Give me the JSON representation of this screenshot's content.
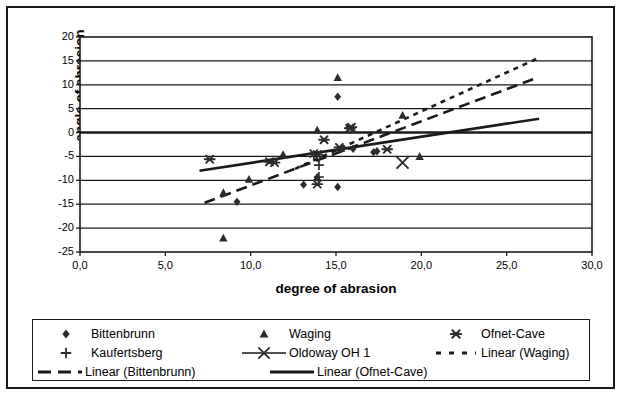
{
  "chart_data": {
    "type": "scatter",
    "title": "",
    "xlabel": "degree of abrasion",
    "ylabel": "angle of abrasion",
    "xlim": [
      0,
      30
    ],
    "ylim": [
      -25,
      20
    ],
    "xticks": [
      "0,0",
      "5,0",
      "10,0",
      "15,0",
      "20,0",
      "25,0",
      "30,0"
    ],
    "xtick_values": [
      0,
      5,
      10,
      15,
      20,
      25,
      30
    ],
    "yticks": [
      "20",
      "15",
      "10",
      "5",
      "0",
      "-5",
      "-10",
      "-15",
      "-20",
      "-25"
    ],
    "ytick_values": [
      20,
      15,
      10,
      5,
      0,
      -5,
      -10,
      -15,
      -20,
      -25
    ],
    "grid": "horizontal",
    "legend_position": "below",
    "series": [
      {
        "name": "Bittenbrunn",
        "marker": "diamond",
        "points": [
          [
            9.2,
            -14.5
          ],
          [
            13.1,
            -10.9
          ],
          [
            13.9,
            -9.4
          ],
          [
            15.1,
            -11.4
          ],
          [
            15.1,
            7.5
          ],
          [
            15.4,
            -3.3
          ],
          [
            16.0,
            -3.4
          ],
          [
            17.2,
            -4.1
          ],
          [
            17.4,
            -3.9
          ]
        ]
      },
      {
        "name": "Waging",
        "marker": "triangle",
        "points": [
          [
            8.4,
            -12.6
          ],
          [
            8.4,
            -22.1
          ],
          [
            9.9,
            -9.8
          ],
          [
            11.9,
            -4.6
          ],
          [
            13.9,
            -9.4
          ],
          [
            13.9,
            0.5
          ],
          [
            15.1,
            11.5
          ],
          [
            15.3,
            -3.3
          ],
          [
            18.9,
            3.6
          ],
          [
            19.9,
            -5.0
          ]
        ]
      },
      {
        "name": "Ofnet-Cave",
        "marker": "asterisk-x",
        "points": [
          [
            7.6,
            -5.6
          ],
          [
            11.1,
            -6.1
          ],
          [
            11.4,
            -6.3
          ],
          [
            13.7,
            -4.4
          ],
          [
            13.9,
            -4.6
          ],
          [
            13.9,
            -10.8
          ],
          [
            14.3,
            -1.5
          ],
          [
            15.2,
            -3.1
          ],
          [
            15.8,
            0.9
          ],
          [
            15.9,
            1.1
          ],
          [
            18.0,
            -3.5
          ]
        ]
      },
      {
        "name": "Kaufertsberg",
        "marker": "plus",
        "points": [
          [
            14.0,
            -6.8
          ],
          [
            14.0,
            -9.3
          ]
        ]
      },
      {
        "name": "Oldoway OH 1",
        "marker": "line-x",
        "points": [
          [
            18.9,
            -6.3
          ]
        ]
      }
    ],
    "trendlines": [
      {
        "name": "Linear (Waging)",
        "style": "dotted-dash",
        "x0": 12.6,
        "y0": -7.6,
        "x1": 26.8,
        "y1": 15.5
      },
      {
        "name": "Linear (Bittenbrunn)",
        "style": "long-dash",
        "x0": 7.3,
        "y0": -14.7,
        "x1": 26.8,
        "y1": 11.5
      },
      {
        "name": "Linear (Ofnet-Cave)",
        "style": "solid",
        "x0": 7.0,
        "y0": -8.0,
        "x1": 26.9,
        "y1": 2.9
      }
    ]
  },
  "legend": {
    "rows": [
      [
        {
          "label": "Bittenbrunn",
          "key": "diamond"
        },
        {
          "label": "Waging",
          "key": "triangle"
        },
        {
          "label": "Ofnet-Cave",
          "key": "asterisk-x"
        }
      ],
      [
        {
          "label": "Kaufertsberg",
          "key": "plus"
        },
        {
          "label": "Oldoway OH 1",
          "key": "line-x"
        },
        {
          "label": "Linear (Waging)",
          "key": "dotted-dash"
        }
      ],
      [
        {
          "label": "Linear (Bittenbrunn)",
          "key": "long-dash"
        },
        {
          "label": "Linear (Ofnet-Cave)",
          "key": "solid"
        }
      ]
    ]
  },
  "colors": {
    "ink": "#1a1a1a",
    "marker": "#2b2b2b",
    "background": "#ffffff"
  }
}
